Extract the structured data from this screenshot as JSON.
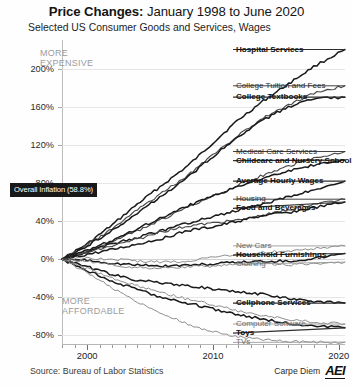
{
  "header": {
    "title_strong": "Price Changes:",
    "title_rest": " January 1998 to June 2020",
    "subtitle": "Selected US Consumer Goods and Services, Wages"
  },
  "footer": {
    "source": "Source: Bureau of Labor Statistics",
    "brand_text": "Carpe Diem",
    "brand_logo": "AEI"
  },
  "annotations": {
    "more_expensive": "MORE\nEXPENSIVE",
    "more_affordable": "MORE\nAFFORDABLE",
    "overall_inflation": "Overall Inflation (58.8%)"
  },
  "chart_data": {
    "type": "line",
    "title": "Price Changes: January 1998 to June 2020",
    "subtitle": "Selected US Consumer Goods and Services, Wages",
    "xlabel": "",
    "ylabel": "",
    "x": [
      1998,
      2000,
      2010,
      2020.5
    ],
    "xlim": [
      1998,
      2020.5
    ],
    "ylim": [
      -90,
      230
    ],
    "xticks": [
      2000,
      2010,
      2020
    ],
    "xtick_labels": [
      "2000",
      "2010",
      "2020"
    ],
    "yticks": [
      200,
      160,
      120,
      80,
      40,
      0,
      -40,
      -80
    ],
    "ytick_labels": [
      "200%",
      "160%",
      "120%",
      "80%",
      "40%",
      "0%",
      "-40%",
      "-80%"
    ],
    "grid": true,
    "legend": "right-inline-labels",
    "reference_line": {
      "label": "Overall Inflation (58.8%)",
      "value": 58.8
    },
    "series": [
      {
        "name": "Hospital Services",
        "end_value": 220,
        "style": "bold",
        "points": [
          [
            1998,
            0
          ],
          [
            2000,
            16
          ],
          [
            2002,
            36
          ],
          [
            2004,
            58
          ],
          [
            2006,
            78
          ],
          [
            2008,
            98
          ],
          [
            2010,
            122
          ],
          [
            2012,
            146
          ],
          [
            2014,
            166
          ],
          [
            2016,
            184
          ],
          [
            2018,
            202
          ],
          [
            2020.5,
            220
          ]
        ]
      },
      {
        "name": "College Tuition and Fees",
        "end_value": 182,
        "style": "normal",
        "points": [
          [
            1998,
            0
          ],
          [
            2000,
            15
          ],
          [
            2002,
            32
          ],
          [
            2004,
            52
          ],
          [
            2006,
            70
          ],
          [
            2008,
            88
          ],
          [
            2010,
            110
          ],
          [
            2012,
            130
          ],
          [
            2014,
            148
          ],
          [
            2016,
            162
          ],
          [
            2018,
            174
          ],
          [
            2020.5,
            182
          ]
        ]
      },
      {
        "name": "College Textbooks",
        "end_value": 170,
        "style": "bold",
        "points": [
          [
            1998,
            0
          ],
          [
            2000,
            14
          ],
          [
            2002,
            30
          ],
          [
            2004,
            49
          ],
          [
            2006,
            67
          ],
          [
            2008,
            86
          ],
          [
            2010,
            108
          ],
          [
            2012,
            128
          ],
          [
            2014,
            146
          ],
          [
            2016,
            160
          ],
          [
            2018,
            168
          ],
          [
            2020.5,
            170
          ]
        ]
      },
      {
        "name": "Medical Care Services",
        "end_value": 113,
        "style": "normal",
        "points": [
          [
            1998,
            0
          ],
          [
            2000,
            8
          ],
          [
            2002,
            18
          ],
          [
            2004,
            30
          ],
          [
            2006,
            42
          ],
          [
            2008,
            54
          ],
          [
            2010,
            66
          ],
          [
            2012,
            78
          ],
          [
            2014,
            88
          ],
          [
            2016,
            98
          ],
          [
            2018,
            106
          ],
          [
            2020.5,
            113
          ]
        ]
      },
      {
        "name": "Childcare and Nursery School",
        "end_value": 104,
        "style": "bold",
        "points": [
          [
            1998,
            0
          ],
          [
            2000,
            9
          ],
          [
            2002,
            20
          ],
          [
            2004,
            32
          ],
          [
            2006,
            44
          ],
          [
            2008,
            56
          ],
          [
            2010,
            66
          ],
          [
            2012,
            76
          ],
          [
            2014,
            85
          ],
          [
            2016,
            93
          ],
          [
            2018,
            99
          ],
          [
            2020.5,
            104
          ]
        ]
      },
      {
        "name": "Average Hourly Wages",
        "end_value": 82,
        "style": "bold",
        "points": [
          [
            1998,
            0
          ],
          [
            2000,
            8
          ],
          [
            2002,
            16
          ],
          [
            2004,
            23
          ],
          [
            2006,
            30
          ],
          [
            2008,
            38
          ],
          [
            2010,
            45
          ],
          [
            2012,
            51
          ],
          [
            2014,
            58
          ],
          [
            2016,
            66
          ],
          [
            2018,
            73
          ],
          [
            2020.5,
            82
          ]
        ]
      },
      {
        "name": "Housing",
        "end_value": 63,
        "style": "normal",
        "points": [
          [
            1998,
            0
          ],
          [
            2000,
            7
          ],
          [
            2002,
            14
          ],
          [
            2004,
            21
          ],
          [
            2006,
            29
          ],
          [
            2008,
            35
          ],
          [
            2010,
            38
          ],
          [
            2012,
            41
          ],
          [
            2014,
            46
          ],
          [
            2016,
            52
          ],
          [
            2018,
            58
          ],
          [
            2020.5,
            63
          ]
        ]
      },
      {
        "name": "Food and Beverages",
        "end_value": 60,
        "style": "bold",
        "points": [
          [
            1998,
            0
          ],
          [
            2000,
            5
          ],
          [
            2002,
            10
          ],
          [
            2004,
            16
          ],
          [
            2006,
            22
          ],
          [
            2008,
            30
          ],
          [
            2010,
            34
          ],
          [
            2012,
            40
          ],
          [
            2014,
            46
          ],
          [
            2016,
            49
          ],
          [
            2018,
            54
          ],
          [
            2020.5,
            60
          ]
        ]
      },
      {
        "name": "New Cars",
        "end_value": 14,
        "style": "faint",
        "points": [
          [
            1998,
            0
          ],
          [
            2000,
            1
          ],
          [
            2002,
            0
          ],
          [
            2004,
            -2
          ],
          [
            2006,
            -3
          ],
          [
            2008,
            -2
          ],
          [
            2010,
            2
          ],
          [
            2012,
            5
          ],
          [
            2014,
            7
          ],
          [
            2016,
            9
          ],
          [
            2018,
            11
          ],
          [
            2020.5,
            14
          ]
        ]
      },
      {
        "name": "Household Furnishings",
        "end_value": 6,
        "style": "bold",
        "points": [
          [
            1998,
            0
          ],
          [
            2000,
            -1
          ],
          [
            2002,
            -4
          ],
          [
            2004,
            -6
          ],
          [
            2006,
            -7
          ],
          [
            2008,
            -6
          ],
          [
            2010,
            -5
          ],
          [
            2012,
            -3
          ],
          [
            2014,
            -2
          ],
          [
            2016,
            -2
          ],
          [
            2018,
            1
          ],
          [
            2020.5,
            6
          ]
        ]
      },
      {
        "name": "Clothing",
        "end_value": -3,
        "style": "faint",
        "points": [
          [
            1998,
            0
          ],
          [
            2000,
            -2
          ],
          [
            2002,
            -6
          ],
          [
            2004,
            -9
          ],
          [
            2006,
            -9
          ],
          [
            2008,
            -8
          ],
          [
            2010,
            -7
          ],
          [
            2012,
            -5
          ],
          [
            2014,
            -5
          ],
          [
            2016,
            -6
          ],
          [
            2018,
            -5
          ],
          [
            2020.5,
            -3
          ]
        ]
      },
      {
        "name": "Cellphone Services",
        "end_value": -46,
        "style": "bold",
        "points": [
          [
            1998,
            0
          ],
          [
            2000,
            -8
          ],
          [
            2002,
            -16
          ],
          [
            2004,
            -22
          ],
          [
            2006,
            -25
          ],
          [
            2008,
            -28
          ],
          [
            2010,
            -31
          ],
          [
            2012,
            -34
          ],
          [
            2014,
            -37
          ],
          [
            2016,
            -41
          ],
          [
            2018,
            -44
          ],
          [
            2020.5,
            -46
          ]
        ]
      },
      {
        "name": "Computer Software",
        "end_value": -68,
        "style": "faint",
        "points": [
          [
            1998,
            0
          ],
          [
            2000,
            -10
          ],
          [
            2002,
            -20
          ],
          [
            2004,
            -28
          ],
          [
            2006,
            -35
          ],
          [
            2008,
            -42
          ],
          [
            2010,
            -48
          ],
          [
            2012,
            -54
          ],
          [
            2014,
            -59
          ],
          [
            2016,
            -63
          ],
          [
            2018,
            -66
          ],
          [
            2020.5,
            -68
          ]
        ]
      },
      {
        "name": "Toys",
        "end_value": -72,
        "style": "bold",
        "points": [
          [
            1998,
            0
          ],
          [
            2000,
            -12
          ],
          [
            2002,
            -23
          ],
          [
            2004,
            -32
          ],
          [
            2006,
            -40
          ],
          [
            2008,
            -46
          ],
          [
            2010,
            -52
          ],
          [
            2012,
            -58
          ],
          [
            2014,
            -63
          ],
          [
            2016,
            -67
          ],
          [
            2018,
            -70
          ],
          [
            2020.5,
            -72
          ]
        ]
      },
      {
        "name": "TVs",
        "end_value": -87,
        "style": "faint",
        "points": [
          [
            1998,
            0
          ],
          [
            2000,
            -14
          ],
          [
            2002,
            -30
          ],
          [
            2004,
            -45
          ],
          [
            2006,
            -58
          ],
          [
            2008,
            -68
          ],
          [
            2010,
            -76
          ],
          [
            2012,
            -81
          ],
          [
            2014,
            -84
          ],
          [
            2016,
            -86
          ],
          [
            2018,
            -87
          ],
          [
            2020.5,
            -87
          ]
        ]
      }
    ]
  }
}
